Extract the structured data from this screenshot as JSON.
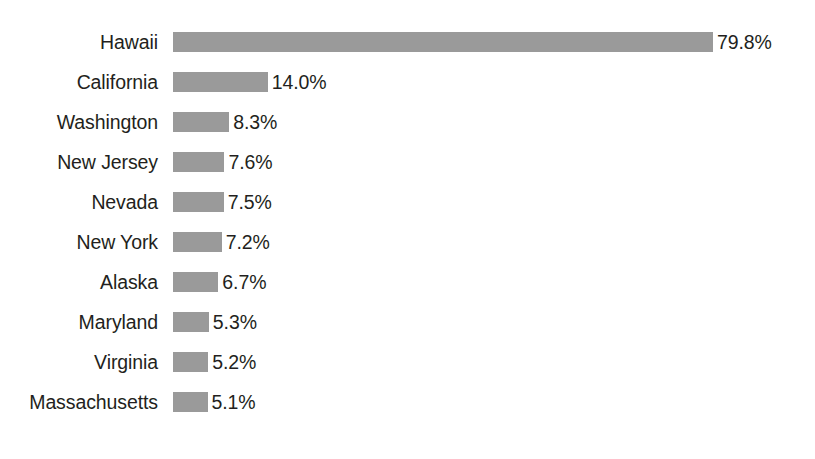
{
  "chart_data": {
    "type": "bar",
    "orientation": "horizontal",
    "title": "",
    "subtitle": "",
    "xlabel": "",
    "ylabel": "",
    "grid": false,
    "legend": "none",
    "axis_visible": false,
    "value_suffix": "%",
    "xlim": [
      0,
      79.8
    ],
    "bar_color": "#9a9a9a",
    "text_color": "#231f20",
    "background": "#ffffff",
    "categories": [
      "Hawaii",
      "California",
      "Washington",
      "New Jersey",
      "Nevada",
      "New York",
      "Alaska",
      "Maryland",
      "Virginia",
      "Massachusetts"
    ],
    "values": [
      79.8,
      14.0,
      8.3,
      7.6,
      7.5,
      7.2,
      6.7,
      5.3,
      5.2,
      5.1
    ],
    "value_labels": [
      "79.8%",
      "14.0%",
      "8.3%",
      "7.6%",
      "7.5%",
      "7.2%",
      "6.7%",
      "5.3%",
      "5.2%",
      "5.1%"
    ],
    "rows": [
      {
        "label": "Hawaii",
        "value": 79.8,
        "value_label": "79.8%"
      },
      {
        "label": "California",
        "value": 14.0,
        "value_label": "14.0%"
      },
      {
        "label": "Washington",
        "value": 8.3,
        "value_label": "8.3%"
      },
      {
        "label": "New Jersey",
        "value": 7.6,
        "value_label": "7.6%"
      },
      {
        "label": "Nevada",
        "value": 7.5,
        "value_label": "7.5%"
      },
      {
        "label": "New York",
        "value": 7.2,
        "value_label": "7.2%"
      },
      {
        "label": "Alaska",
        "value": 6.7,
        "value_label": "6.7%"
      },
      {
        "label": "Maryland",
        "value": 5.3,
        "value_label": "5.3%"
      },
      {
        "label": "Virginia",
        "value": 5.2,
        "value_label": "5.2%"
      },
      {
        "label": "Massachusetts",
        "value": 5.1,
        "value_label": "5.1%"
      }
    ]
  },
  "layout": {
    "bar_origin_x": 173,
    "px_per_unit": 6.7669,
    "first_row_top": 27,
    "row_pitch": 40,
    "bar_height": 20
  }
}
